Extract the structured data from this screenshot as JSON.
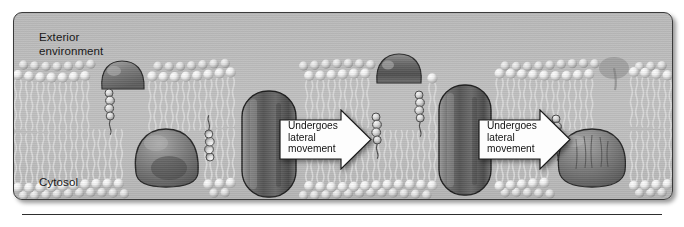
{
  "figure": {
    "panel": {
      "background_color": "#bdbdbd",
      "border_color": "#3a3a3a"
    },
    "labels": {
      "exterior": "Exterior\nenvironment",
      "cytosol": "Cytosol"
    },
    "callouts": [
      {
        "id": "arrow-1",
        "text": "Undergoes\nlateral\nmovement",
        "direction": "right",
        "fill_color": "#fdfdfd",
        "outline_color": "#1c1c1c"
      },
      {
        "id": "arrow-2",
        "text": "Undergoes\nlateral\nmovement",
        "direction": "right",
        "fill_color": "#fdfdfd",
        "outline_color": "#1c1c1c"
      }
    ],
    "structures": {
      "bilayer": {
        "name": "phospholipid-bilayer",
        "leaflets": [
          "outer",
          "inner"
        ],
        "head_color": "#e9e9e9",
        "tail_color": "#cfcfcf"
      },
      "cholesterol_molecules": [
        {
          "name": "cholesterol",
          "x": 95,
          "leaflet": "outer"
        },
        {
          "name": "cholesterol",
          "x": 196,
          "leaflet": "inner"
        },
        {
          "name": "cholesterol",
          "x": 362,
          "leaflet": "outer"
        },
        {
          "name": "cholesterol",
          "x": 405,
          "leaflet": "inner"
        },
        {
          "name": "cholesterol",
          "x": 542,
          "leaflet": "outer"
        }
      ],
      "proteins": [
        {
          "name": "peripheral-protein-left",
          "type": "peripheral",
          "side": "exterior"
        },
        {
          "name": "integral-protein-left",
          "type": "integral",
          "side": "cytosol"
        },
        {
          "name": "transmembrane-protein-center",
          "type": "transmembrane",
          "side": "spanning"
        },
        {
          "name": "peripheral-protein-upper-right",
          "type": "peripheral",
          "side": "exterior"
        },
        {
          "name": "transmembrane-protein-right",
          "type": "transmembrane",
          "side": "spanning"
        },
        {
          "name": "integral-protein-right",
          "type": "integral",
          "side": "cytosol"
        },
        {
          "name": "peripheral-protein-far-right",
          "type": "peripheral",
          "side": "exterior"
        }
      ]
    }
  }
}
